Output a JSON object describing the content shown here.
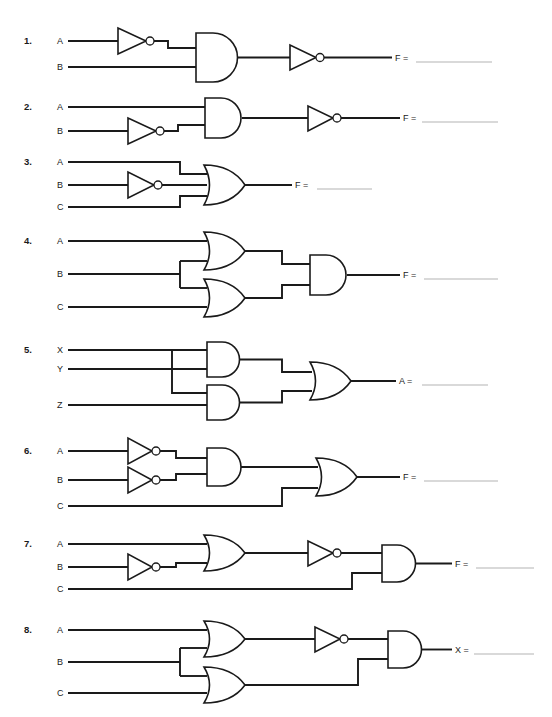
{
  "page": {
    "background_color": "#ffffff",
    "ink_color": "#1a1a1a",
    "answer_line_color": "#b4b4b4",
    "width": 552,
    "height": 717
  },
  "problems": [
    {
      "number": "1.",
      "inputs": [
        "A",
        "B"
      ],
      "output_label": "F =",
      "gates": [
        "NOT",
        "AND",
        "NOT"
      ],
      "description": "A inverted, ANDed with B, result inverted"
    },
    {
      "number": "2.",
      "inputs": [
        "A",
        "B"
      ],
      "output_label": "F =",
      "gates": [
        "NOT",
        "AND",
        "NOT"
      ],
      "description": "B inverted, ANDed with A, result inverted"
    },
    {
      "number": "3.",
      "inputs": [
        "A",
        "B",
        "C"
      ],
      "output_label": "F =",
      "gates": [
        "NOT",
        "OR"
      ],
      "description": "A, inverted B, and C into a three-input OR"
    },
    {
      "number": "4.",
      "inputs": [
        "A",
        "B",
        "C"
      ],
      "output_label": "F =",
      "gates": [
        "OR",
        "OR",
        "AND"
      ],
      "description": "A OR B, B OR C, the two results ANDed"
    },
    {
      "number": "5.",
      "inputs": [
        "X",
        "Y",
        "Z"
      ],
      "output_label": "A =",
      "gates": [
        "AND",
        "AND",
        "OR"
      ],
      "description": "X AND Y, X AND Z, the two results ORed"
    },
    {
      "number": "6.",
      "inputs": [
        "A",
        "B",
        "C"
      ],
      "output_label": "F =",
      "gates": [
        "NOT",
        "NOT",
        "AND",
        "OR"
      ],
      "description": "inverted A AND inverted B, ORed with C"
    },
    {
      "number": "7.",
      "inputs": [
        "A",
        "B",
        "C"
      ],
      "output_label": "F =",
      "gates": [
        "NOT",
        "OR",
        "NOT",
        "AND"
      ],
      "description": "A OR inverted B, inverted, then ANDed with C"
    },
    {
      "number": "8.",
      "inputs": [
        "A",
        "B",
        "C"
      ],
      "output_label": "X =",
      "gates": [
        "OR",
        "OR",
        "NOT",
        "AND"
      ],
      "description": "A OR B inverted, ANDed with B OR C"
    }
  ]
}
